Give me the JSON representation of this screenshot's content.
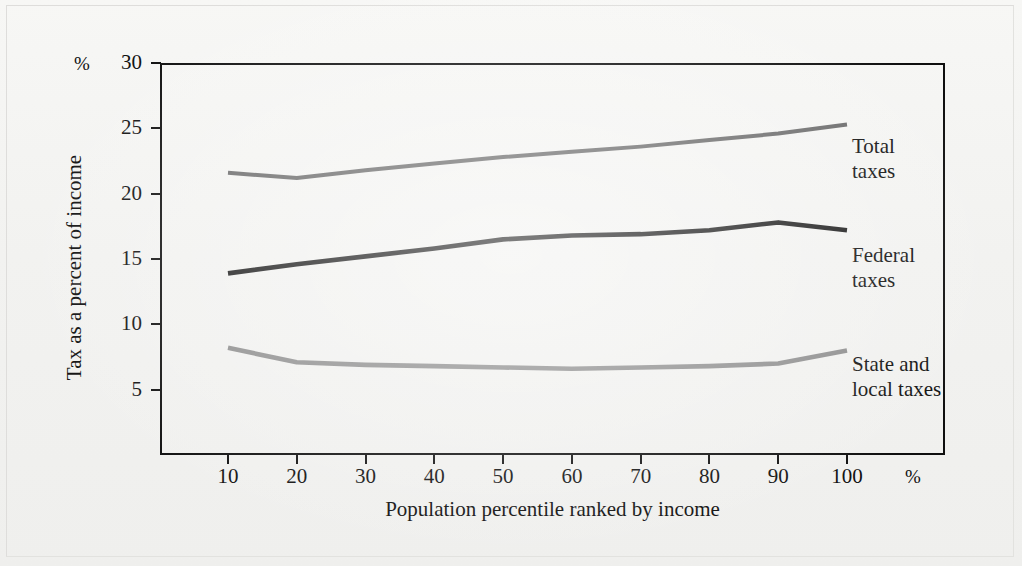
{
  "figure": {
    "y_axis_title": "Tax as a percent of income",
    "x_axis_title": "Population percentile ranked by income",
    "y_unit_symbol": "%",
    "x_unit_symbol": "%"
  },
  "colors": {
    "total_taxes": "#6a6a6a",
    "federal_taxes": "#1a1a1a",
    "state_local_taxes": "#8d8d8d",
    "axis": "#0f0f0f",
    "background": "#f4f4f2"
  },
  "labels": {
    "total": "Total\ntaxes",
    "total_line1": "Total",
    "total_line2": "taxes",
    "federal_line1": "Federal",
    "federal_line2": "taxes",
    "state_line1": "State and",
    "state_line2": "local taxes"
  },
  "chart_data": {
    "type": "line",
    "title": "",
    "subtitle": "",
    "xlabel": "Population percentile ranked by income",
    "ylabel": "Tax as a percent of income",
    "xlim": [
      0,
      105
    ],
    "ylim": [
      0,
      30
    ],
    "xticks": [
      10,
      20,
      30,
      40,
      50,
      60,
      70,
      80,
      90,
      100
    ],
    "yticks": [
      5,
      10,
      15,
      20,
      25,
      30
    ],
    "xtick_labels": [
      "10",
      "20",
      "30",
      "40",
      "50",
      "60",
      "70",
      "80",
      "90",
      "100"
    ],
    "ytick_labels": [
      "5",
      "10",
      "15",
      "20",
      "25",
      "30"
    ],
    "x_unit": "%",
    "y_unit": "%",
    "grid": false,
    "legend": "inline-right-of-line-ends",
    "x": [
      10,
      20,
      30,
      40,
      50,
      60,
      70,
      80,
      90,
      100
    ],
    "series": [
      {
        "name": "Total taxes",
        "color": "#6a6a6a",
        "values": [
          21.6,
          21.2,
          21.8,
          22.3,
          22.8,
          23.2,
          23.6,
          24.1,
          24.6,
          25.3
        ],
        "label_line1": "Total",
        "label_line2": "taxes"
      },
      {
        "name": "Federal taxes",
        "color": "#1a1a1a",
        "values": [
          13.9,
          14.6,
          15.2,
          15.8,
          16.5,
          16.8,
          16.9,
          17.2,
          17.8,
          17.2
        ],
        "label_line1": "Federal",
        "label_line2": "taxes"
      },
      {
        "name": "State and local taxes",
        "color": "#8d8d8d",
        "values": [
          8.2,
          7.1,
          6.9,
          6.8,
          6.7,
          6.6,
          6.7,
          6.8,
          7.0,
          8.0
        ],
        "label_line1": "State and",
        "label_line2": "local taxes"
      }
    ]
  }
}
